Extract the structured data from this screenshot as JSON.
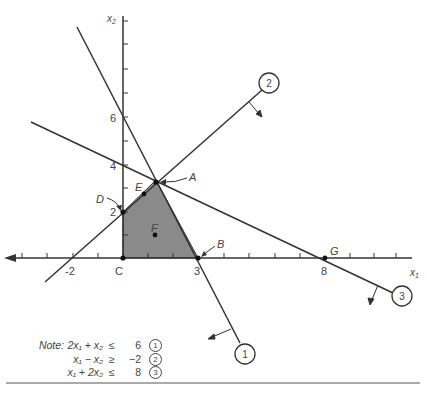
{
  "diagram": {
    "type": "linear-programming-feasible-region",
    "axes": {
      "x_label": "x1",
      "y_label": "x2",
      "x_tick_labels": [
        "-2",
        "3",
        "8"
      ],
      "y_tick_labels": [
        "2",
        "4",
        "6"
      ],
      "origin_label": "C"
    },
    "points": [
      {
        "label": "A",
        "coords": "(4/3, 10/3)"
      },
      {
        "label": "B",
        "coords": "(3, 0)"
      },
      {
        "label": "C",
        "coords": "(0, 0)"
      },
      {
        "label": "D",
        "coords": "(0, 2)"
      },
      {
        "label": "E",
        "coords": "on line 2"
      },
      {
        "label": "F",
        "coords": "interior"
      },
      {
        "label": "G",
        "coords": "(8, 0)"
      }
    ],
    "constraint_markers": [
      "1",
      "2",
      "3"
    ],
    "feasible_region_color": "#8a8a8a",
    "line_color": "#333333"
  },
  "note": {
    "lead": "Note:",
    "rows": [
      {
        "lhs": "2x₁ +   x₂",
        "op": "≤",
        "rhs": "6",
        "marker": "1"
      },
      {
        "lhs": "x₁ −   x₂",
        "op": "≥",
        "rhs": "−2",
        "marker": "2"
      },
      {
        "lhs": "x₁ + 2x₂",
        "op": "≤",
        "rhs": "8",
        "marker": "3"
      }
    ]
  }
}
